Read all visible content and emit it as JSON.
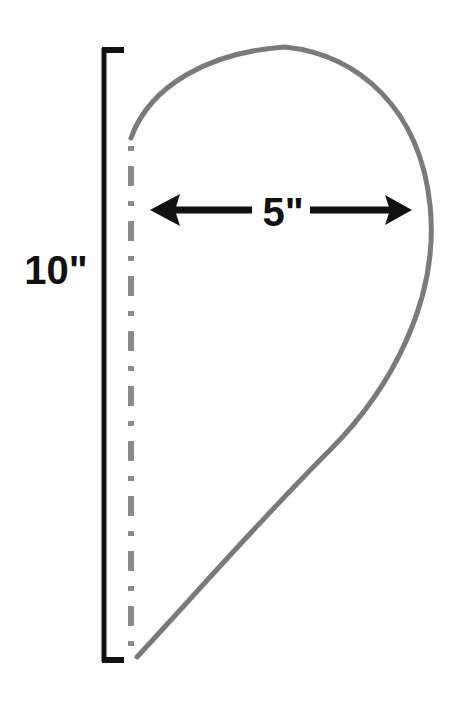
{
  "diagram": {
    "title": "",
    "shape": "teardrop half pattern",
    "height_label": "10\"",
    "width_label": "5\"",
    "colors": {
      "outline": "#7a7a7a",
      "fold_line": "#8a8a8a",
      "dimension": "#111111",
      "background": "#ffffff"
    }
  }
}
